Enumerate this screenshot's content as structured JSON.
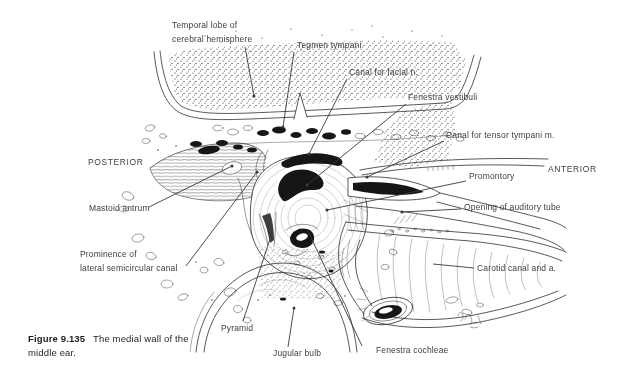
{
  "caption": {
    "figure_number": "Figure 9.135",
    "line1_rest": "The medial wall of the",
    "line2": "middle ear."
  },
  "orientation": {
    "posterior": "POSTERIOR",
    "anterior": "ANTERIOR"
  },
  "labels": {
    "temporal_lobe_line1": "Temporal lobe of",
    "temporal_lobe_line2": "cerebral hemisphere",
    "tegmen_tympani": "Tegmen tympani",
    "canal_for_facial_n": "Canal for facial n.",
    "fenestra_vestibuli": "Fenestra vestibuli",
    "canal_for_tensor_tympani_m": "Canal for tensor tympani m.",
    "promontory": "Promontory",
    "mastoid_antrum": "Mastoid antrum",
    "opening_of_auditory_tube": "Opening of auditory tube",
    "prominence_line1": "Prominence of",
    "prominence_line2": "lateral semicircular canal",
    "carotid_canal_and_a": "Carotid canal and a.",
    "pyramid": "Pyramid",
    "jugular_bulb": "Jugular bulb",
    "fenestra_cochleae": "Fenestra cochleae"
  },
  "colors": {
    "ink": "#2e2e2e",
    "label_text": "#3e3e3e",
    "background": "#ffffff"
  }
}
